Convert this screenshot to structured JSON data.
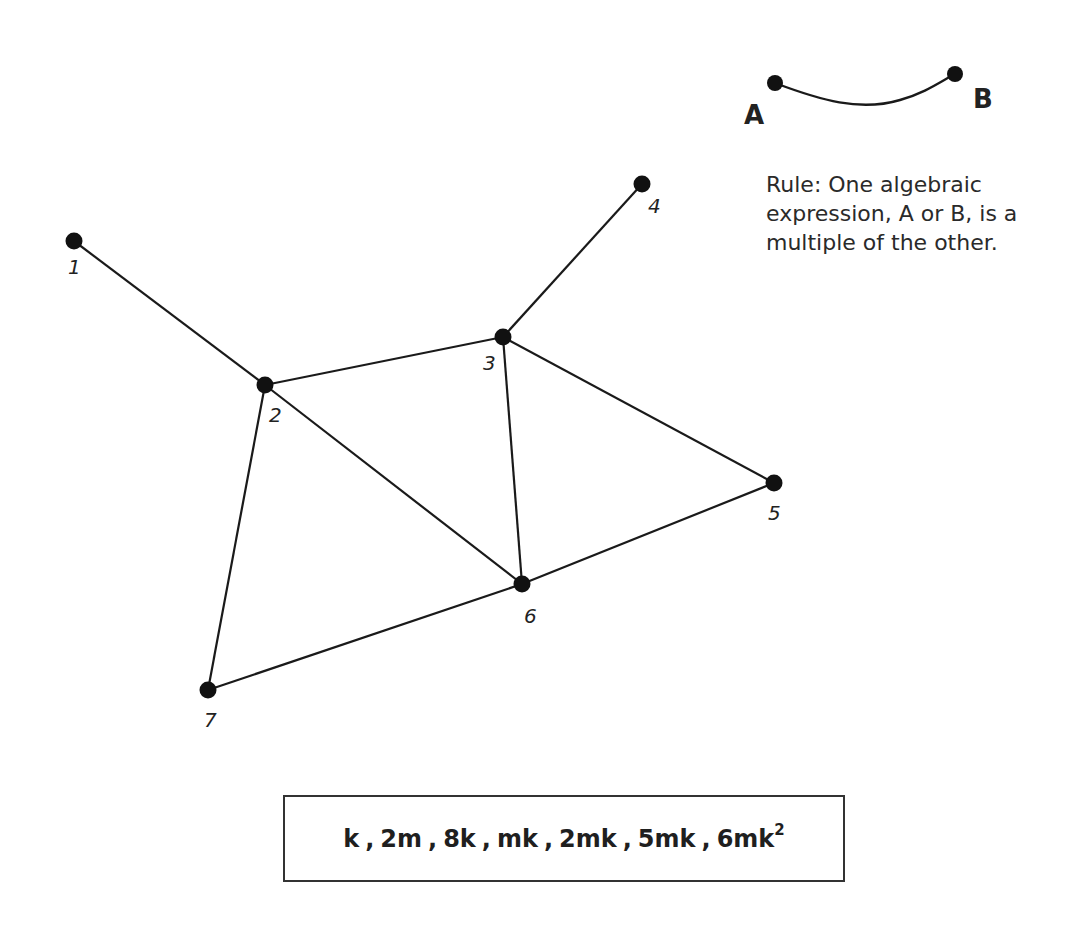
{
  "legend": {
    "endpoint_a": "A",
    "endpoint_b": "B",
    "rule": "Rule: One algebraic expression, A or B, is a multiple of the other."
  },
  "graph": {
    "nodes": [
      {
        "id": "1",
        "label": "1",
        "x": 74,
        "y": 241
      },
      {
        "id": "2",
        "label": "2",
        "x": 265,
        "y": 385
      },
      {
        "id": "3",
        "label": "3",
        "x": 503,
        "y": 337
      },
      {
        "id": "4",
        "label": "4",
        "x": 642,
        "y": 184
      },
      {
        "id": "5",
        "label": "5",
        "x": 774,
        "y": 483
      },
      {
        "id": "6",
        "label": "6",
        "x": 522,
        "y": 584
      },
      {
        "id": "7",
        "label": "7",
        "x": 208,
        "y": 690
      }
    ],
    "edges": [
      [
        "1",
        "2"
      ],
      [
        "2",
        "3"
      ],
      [
        "3",
        "4"
      ],
      [
        "3",
        "5"
      ],
      [
        "3",
        "6"
      ],
      [
        "2",
        "6"
      ],
      [
        "2",
        "7"
      ],
      [
        "5",
        "6"
      ],
      [
        "6",
        "7"
      ]
    ]
  },
  "expressions": {
    "items": [
      {
        "base": "k",
        "sup": ""
      },
      {
        "base": "2m",
        "sup": ""
      },
      {
        "base": "8k",
        "sup": ""
      },
      {
        "base": "mk",
        "sup": ""
      },
      {
        "base": "2mk",
        "sup": ""
      },
      {
        "base": "5mk",
        "sup": ""
      },
      {
        "base": "6mk",
        "sup": "2"
      }
    ],
    "separator": ","
  }
}
